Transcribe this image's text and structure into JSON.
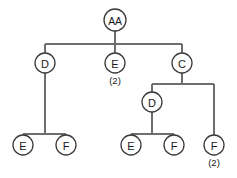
{
  "diagram": {
    "type": "tree",
    "canvas": {
      "width": 237,
      "height": 178,
      "background": "#ffffff"
    },
    "style": {
      "line_color": "#6e6e6e",
      "node_stroke": "#3a3a3a",
      "node_fill": "#ffffff",
      "text_color": "#1a1a1a"
    },
    "nodes": [
      {
        "id": "root",
        "label": "AA",
        "count": "",
        "cx": 115,
        "cy": 20,
        "r": 11,
        "level": 0
      },
      {
        "id": "n-d-left",
        "label": "D",
        "count": "",
        "cx": 45,
        "cy": 63,
        "r": 10,
        "level": 1
      },
      {
        "id": "n-e-mid",
        "label": "E",
        "count": "(2)",
        "cx": 115,
        "cy": 63,
        "r": 10,
        "level": 1
      },
      {
        "id": "n-c-right",
        "label": "C",
        "count": "",
        "cx": 182,
        "cy": 63,
        "r": 10,
        "level": 1
      },
      {
        "id": "n-d-right",
        "label": "D",
        "count": "",
        "cx": 152,
        "cy": 102,
        "r": 10,
        "level": 2
      },
      {
        "id": "n-e-ll",
        "label": "E",
        "count": "",
        "cx": 23,
        "cy": 145,
        "r": 10,
        "level": 3
      },
      {
        "id": "n-f-lr",
        "label": "F",
        "count": "",
        "cx": 66,
        "cy": 145,
        "r": 10,
        "level": 3
      },
      {
        "id": "n-e-rl",
        "label": "E",
        "count": "",
        "cx": 131,
        "cy": 145,
        "r": 10,
        "level": 3
      },
      {
        "id": "n-f-rr",
        "label": "F",
        "count": "",
        "cx": 174,
        "cy": 145,
        "r": 10,
        "level": 3
      },
      {
        "id": "n-f-far",
        "label": "F",
        "count": "(2)",
        "cx": 214,
        "cy": 145,
        "r": 10,
        "level": 3
      }
    ],
    "edges": [
      {
        "id": "e-root-stem",
        "from": "root",
        "to": "bar-1",
        "path": "M 115 31 L 115 44"
      },
      {
        "id": "e-bar-1",
        "from": "bar-1",
        "to": "bar-1",
        "path": "M 45 44 L 182 44"
      },
      {
        "id": "e-bar1-d-left",
        "from": "bar-1",
        "to": "n-d-left",
        "path": "M 45 44 L 45 53"
      },
      {
        "id": "e-bar1-e-mid",
        "from": "bar-1",
        "to": "n-e-mid",
        "path": "M 115 44 L 115 53"
      },
      {
        "id": "e-bar1-c-right",
        "from": "bar-1",
        "to": "n-c-right",
        "path": "M 182 44 L 182 53"
      },
      {
        "id": "e-d-left-stem",
        "from": "n-d-left",
        "to": "bar-2",
        "path": "M 45 73 L 45 134"
      },
      {
        "id": "e-bar-2",
        "from": "bar-2",
        "to": "bar-2",
        "path": "M 23 134 L 66 134"
      },
      {
        "id": "e-bar2-e",
        "from": "bar-2",
        "to": "n-e-ll",
        "path": "M 23 134 L 23 135"
      },
      {
        "id": "e-bar2-f",
        "from": "bar-2",
        "to": "n-f-lr",
        "path": "M 66 134 L 66 135"
      },
      {
        "id": "e-c-stem",
        "from": "n-c-right",
        "to": "bar-3",
        "path": "M 182 73 L 182 84"
      },
      {
        "id": "e-bar-3",
        "from": "bar-3",
        "to": "bar-3",
        "path": "M 152 84 L 214 84"
      },
      {
        "id": "e-bar3-d",
        "from": "bar-3",
        "to": "n-d-right",
        "path": "M 152 84 L 152 92"
      },
      {
        "id": "e-bar3-f-far",
        "from": "bar-3",
        "to": "n-f-far",
        "path": "M 214 84 L 214 135"
      },
      {
        "id": "e-d-right-stem",
        "from": "n-d-right",
        "to": "bar-4",
        "path": "M 152 112 L 152 134"
      },
      {
        "id": "e-bar-4",
        "from": "bar-4",
        "to": "bar-4",
        "path": "M 131 134 L 174 134"
      },
      {
        "id": "e-bar4-e",
        "from": "bar-4",
        "to": "n-e-rl",
        "path": "M 131 134 L 131 135"
      },
      {
        "id": "e-bar4-f",
        "from": "bar-4",
        "to": "n-f-rr",
        "path": "M 174 134 L 174 135"
      }
    ]
  }
}
